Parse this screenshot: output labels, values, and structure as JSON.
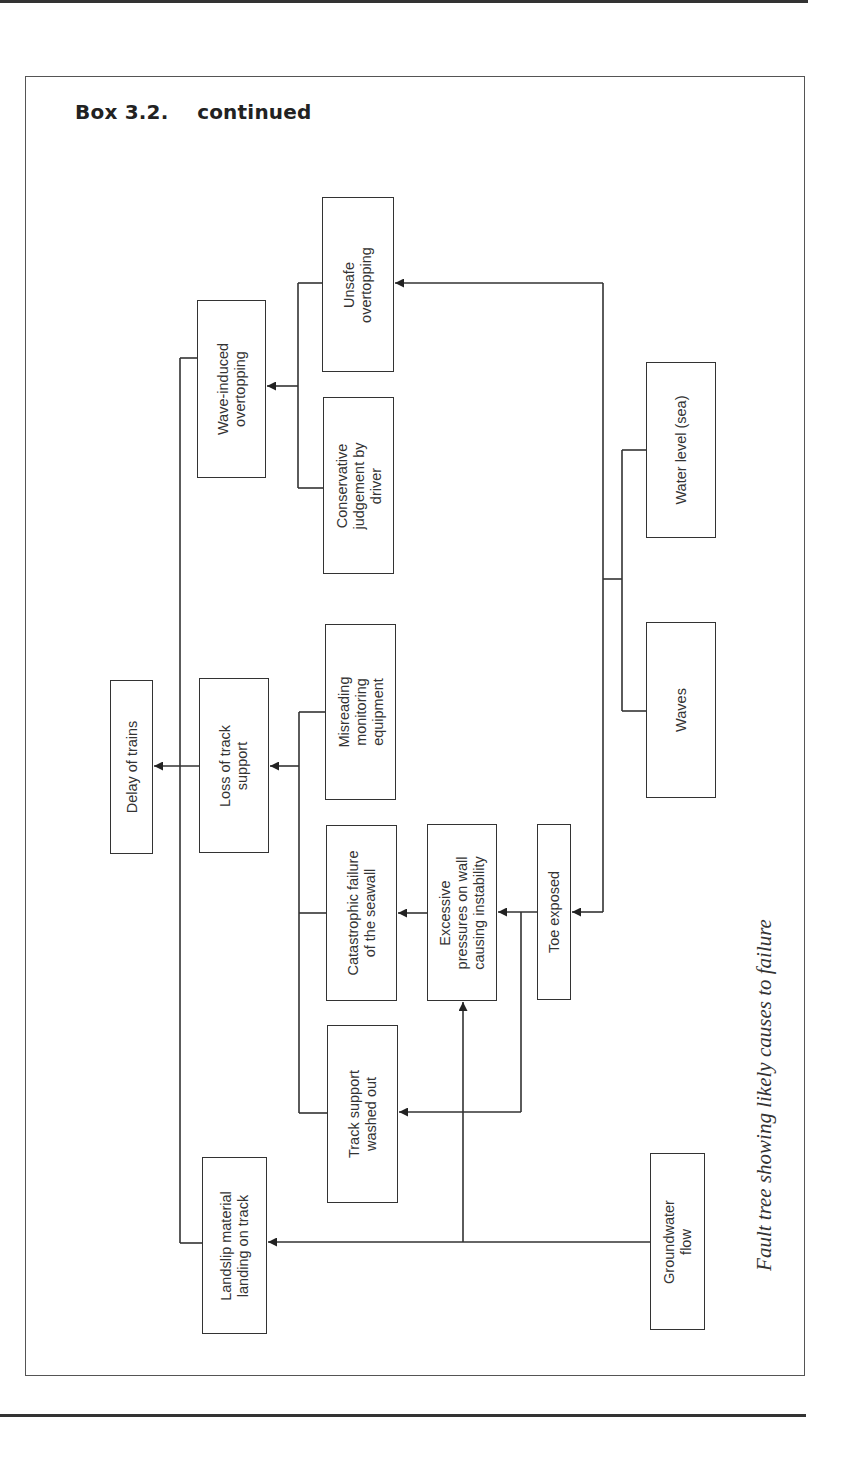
{
  "page": {
    "box_heading": "Box 3.2.    continued",
    "caption": "Fault tree showing likely causes to failure"
  },
  "diagram": {
    "type": "fault-tree",
    "orientation": "rotated 90° counter-clockwise (root at left)",
    "nodes": {
      "delay_of_trains": "Delay of trains",
      "wave_induced_overtopping": "Wave-induced\novertopping",
      "loss_of_track_support": "Loss of track\nsupport",
      "landslip_material": "Landslip material\nlanding on track",
      "unsafe_overtopping": "Unsafe\novertopping",
      "conservative_judgement": "Conservative\njudgement by\ndriver",
      "misreading_monitoring": "Misreading\nmonitoring\nequipment",
      "catastrophic_failure": "Catastrophic failure\nof the seawall",
      "track_support_washed_out": "Track support\nwashed out",
      "excessive_pressures": "Excessive\npressures on wall\ncausing instability",
      "toe_exposed": "Toe exposed",
      "waves": "Waves",
      "water_level": "Water level (sea)",
      "groundwater_flow": "Groundwater\nflow"
    },
    "edges": [
      {
        "from": "Wave-induced overtopping",
        "to": "Delay of trains"
      },
      {
        "from": "Loss of track support",
        "to": "Delay of trains"
      },
      {
        "from": "Landslip material landing on track",
        "to": "Delay of trains"
      },
      {
        "from": "Unsafe overtopping",
        "to": "Wave-induced overtopping"
      },
      {
        "from": "Conservative judgement by driver",
        "to": "Wave-induced overtopping"
      },
      {
        "from": "Misreading monitoring equipment",
        "to": "Loss of track support"
      },
      {
        "from": "Catastrophic failure of the seawall",
        "to": "Loss of track support"
      },
      {
        "from": "Track support washed out",
        "to": "Loss of track support"
      },
      {
        "from": "Excessive pressures on wall causing instability",
        "to": "Catastrophic failure of the seawall"
      },
      {
        "from": "Toe exposed",
        "to": "Excessive pressures on wall causing instability"
      },
      {
        "from": "Toe exposed",
        "to": "Track support washed out"
      },
      {
        "from": "Waves + Water level (sea)",
        "to": "Unsafe overtopping"
      },
      {
        "from": "Waves + Water level (sea)",
        "to": "Toe exposed"
      },
      {
        "from": "Groundwater flow",
        "to": "Landslip material landing on track"
      },
      {
        "from": "Groundwater flow",
        "to": "Excessive pressures on wall causing instability"
      }
    ]
  }
}
